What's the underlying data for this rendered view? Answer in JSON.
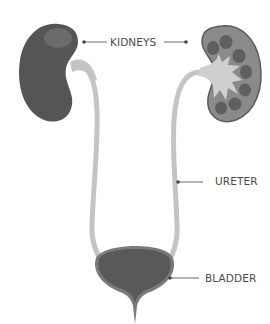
{
  "diagram": {
    "labels": {
      "kidneys": "KIDNEYS",
      "ureter": "URETER",
      "bladder": "BLADDER"
    },
    "parts": [
      {
        "name": "left-kidney",
        "view": "exterior"
      },
      {
        "name": "right-kidney",
        "view": "cross-section"
      },
      {
        "name": "left-ureter"
      },
      {
        "name": "right-ureter"
      },
      {
        "name": "bladder"
      },
      {
        "name": "urethra"
      }
    ],
    "colors": {
      "kidney_exterior": "#555555",
      "kidney_highlight": "#6b6b6b",
      "kidney_section_cortex": "#8a8a8a",
      "kidney_section_outline": "#5a5a5a",
      "calyx": "#5f5f5f",
      "renal_pelvis": "#cfcfcf",
      "ureter": "#c4c4c4",
      "bladder": "#595959",
      "bladder_rim": "#7a7a7a",
      "leader_line": "#444444",
      "text": "#4a4a4a",
      "background": "#ffffff"
    }
  }
}
